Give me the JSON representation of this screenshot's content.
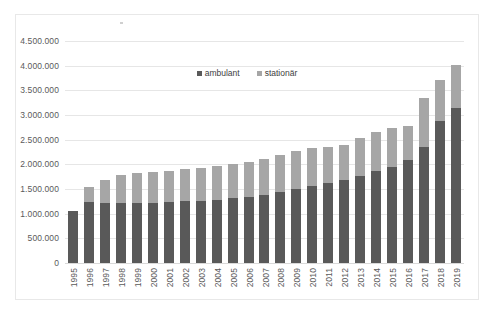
{
  "chart_data": {
    "type": "bar",
    "title": "",
    "subtitle": "",
    "xlabel": "",
    "ylabel": "",
    "stacked": true,
    "grid": true,
    "legend_position": "top-center",
    "ylim": [
      0,
      4500000
    ],
    "ytick_step": 500000,
    "ytick_labels": [
      "4.500.000",
      "4.000.000",
      "3.500.000",
      "3.000.000",
      "2.500.000",
      "2.000.000",
      "1.500.000",
      "1.000.000",
      "500.000",
      "0"
    ],
    "ytick_values": [
      4500000,
      4000000,
      3500000,
      3000000,
      2500000,
      2000000,
      1500000,
      1000000,
      500000,
      0
    ],
    "categories": [
      "1995",
      "1996",
      "1997",
      "1998",
      "1999",
      "2000",
      "2001",
      "2002",
      "2003",
      "2004",
      "2005",
      "2006",
      "2007",
      "2008",
      "2009",
      "2010",
      "2011",
      "2012",
      "2013",
      "2014",
      "2015",
      "2016",
      "2017",
      "2018",
      "2019"
    ],
    "series": [
      {
        "name": "ambulant",
        "color": "#595959",
        "values": [
          1050000,
          1230000,
          1210000,
          1215000,
          1220000,
          1225000,
          1235000,
          1250000,
          1265000,
          1285000,
          1310000,
          1340000,
          1380000,
          1430000,
          1500000,
          1560000,
          1620000,
          1690000,
          1770000,
          1860000,
          1950000,
          2090000,
          2350000,
          2870000,
          3150000
        ]
      },
      {
        "name": "stationär",
        "color": "#a6a6a6",
        "values": [
          0,
          320000,
          480000,
          570000,
          600000,
          620000,
          635000,
          650000,
          665000,
          675000,
          690000,
          710000,
          730000,
          760000,
          780000,
          780000,
          740000,
          710000,
          760000,
          790000,
          790000,
          690000,
          990000,
          830000,
          860000
        ]
      }
    ],
    "totals": [
      1050000,
      1550000,
      1690000,
      1785000,
      1820000,
      1845000,
      1870000,
      1900000,
      1930000,
      1960000,
      2000000,
      2050000,
      2110000,
      2190000,
      2280000,
      2340000,
      2360000,
      2400000,
      2530000,
      2650000,
      2740000,
      2780000,
      3340000,
      3700000,
      4010000
    ]
  },
  "legend": {
    "items": [
      {
        "label": "ambulant"
      },
      {
        "label": "stationär"
      }
    ]
  }
}
